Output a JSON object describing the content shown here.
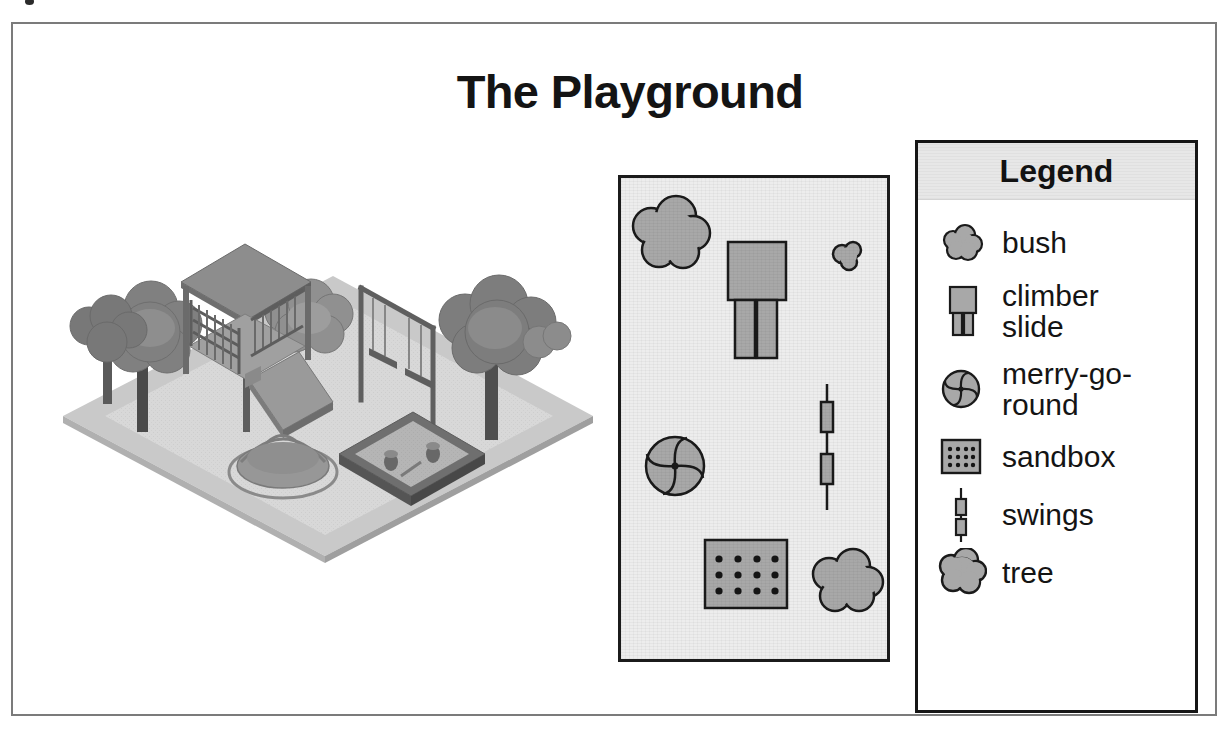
{
  "document": {
    "title": "The Playground"
  },
  "illustration": {
    "name": "isometric-playground-illustration",
    "features": [
      "trees",
      "climber-slide",
      "swings",
      "merry-go-round",
      "sandbox",
      "bushes"
    ]
  },
  "map": {
    "name": "playground-plan-map",
    "items": [
      {
        "type": "tree",
        "x": 45,
        "y": 55,
        "label": "tree"
      },
      {
        "type": "climber-slide",
        "x": 130,
        "y": 100,
        "label": "climber slide"
      },
      {
        "type": "bush",
        "x": 228,
        "y": 78,
        "label": "bush"
      },
      {
        "type": "swings",
        "x": 213,
        "y": 245,
        "label": "swings"
      },
      {
        "type": "merry-go-round",
        "x": 52,
        "y": 262,
        "label": "merry-go-round"
      },
      {
        "type": "sandbox",
        "x": 122,
        "y": 385,
        "label": "sandbox"
      },
      {
        "type": "tree",
        "x": 222,
        "y": 405,
        "label": "tree"
      }
    ]
  },
  "legend": {
    "header": "Legend",
    "items": [
      {
        "icon": "bush-icon",
        "label": "bush"
      },
      {
        "icon": "climber-slide-icon",
        "label": "climber\nslide"
      },
      {
        "icon": "merry-go-round-icon",
        "label": "merry-go-\nround"
      },
      {
        "icon": "sandbox-icon",
        "label": "sandbox"
      },
      {
        "icon": "swings-icon",
        "label": "swings"
      },
      {
        "icon": "tree-icon",
        "label": "tree"
      }
    ]
  },
  "colors": {
    "frame_border": "#7b7b7b",
    "panel_border": "#1b1b1b",
    "map_background": "#ededed",
    "legend_header_background": "#e7e7e7",
    "icon_fill": "#a8a8a8",
    "icon_stroke": "#1a1a1a",
    "ground_light": "#cfcfcf",
    "ground_mid": "#b5b5b5",
    "structure_dark": "#6f6f6f",
    "text": "#141414"
  }
}
